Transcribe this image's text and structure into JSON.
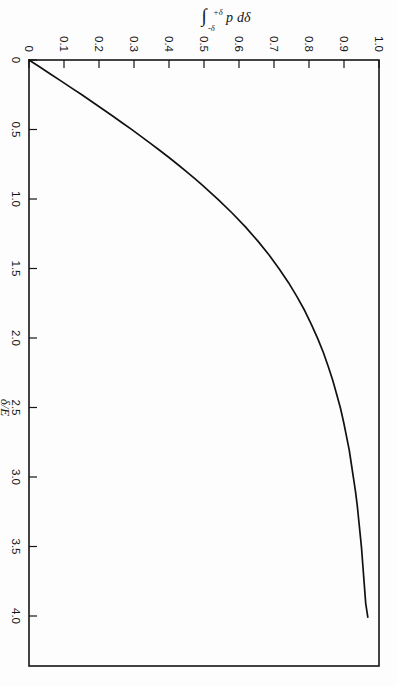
{
  "figure": {
    "background_color": "#fdfdfd",
    "line_color": "#111111",
    "axis_color": "#151515",
    "rotation_degrees": 90,
    "orientation_note": "scanned page, figure printed sideways"
  },
  "chart_data": {
    "type": "line",
    "title": "",
    "subtitle": "",
    "xlabel": "δ/E",
    "ylabel": "∫ p dδ",
    "ylabel_parts": {
      "integral_sign": "∫",
      "lower_limit": "-δ",
      "upper_limit": "+δ",
      "integrand": "p",
      "differential": "dδ"
    },
    "xlim": [
      0,
      4.35
    ],
    "ylim": [
      0,
      1.0
    ],
    "x_ticks": [
      0,
      0.5,
      1.0,
      1.5,
      2.0,
      2.5,
      3.0,
      3.5,
      4.0
    ],
    "x_tick_labels": [
      "0",
      "0.5",
      "1.0",
      "1.5",
      "2.0",
      "2.5",
      "3.0",
      "3.5",
      "4.0"
    ],
    "y_ticks": [
      0,
      0.1,
      0.2,
      0.3,
      0.4,
      0.5,
      0.6,
      0.7,
      0.8,
      0.9,
      1.0
    ],
    "y_tick_labels": [
      "0",
      "0.1",
      "0.2",
      "0.3",
      "0.4",
      "0.5",
      "0.6",
      "0.7",
      "0.8",
      "0.9",
      "1.0"
    ],
    "grid": false,
    "legend": false,
    "legend_position": "none",
    "series": [
      {
        "name": "cumulative probability",
        "x": [
          0.0,
          0.05,
          0.1,
          0.15,
          0.2,
          0.25,
          0.3,
          0.35,
          0.4,
          0.45,
          0.5,
          0.55,
          0.6,
          0.65,
          0.7,
          0.75,
          0.8,
          0.85,
          0.9,
          0.95,
          1.0,
          1.1,
          1.2,
          1.3,
          1.4,
          1.5,
          1.6,
          1.7,
          1.8,
          1.9,
          2.0,
          2.1,
          2.2,
          2.3,
          2.4,
          2.5,
          2.6,
          2.7,
          2.8,
          2.9,
          3.0,
          3.1,
          3.2,
          3.3,
          3.4,
          3.5,
          3.6,
          3.7,
          3.8,
          3.9,
          4.0
        ],
        "y": [
          0.0,
          0.031,
          0.061,
          0.091,
          0.121,
          0.151,
          0.18,
          0.209,
          0.238,
          0.266,
          0.294,
          0.321,
          0.348,
          0.374,
          0.4,
          0.425,
          0.449,
          0.473,
          0.496,
          0.518,
          0.54,
          0.581,
          0.619,
          0.654,
          0.686,
          0.715,
          0.742,
          0.766,
          0.788,
          0.807,
          0.825,
          0.841,
          0.855,
          0.868,
          0.879,
          0.89,
          0.899,
          0.907,
          0.915,
          0.921,
          0.927,
          0.933,
          0.938,
          0.942,
          0.946,
          0.95,
          0.953,
          0.956,
          0.959,
          0.962,
          0.968
        ]
      }
    ],
    "annotations": []
  }
}
